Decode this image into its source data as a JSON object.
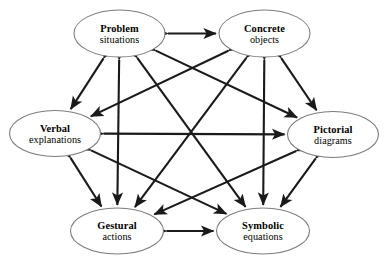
{
  "diagram": {
    "type": "hexagonal-network",
    "colors": {
      "background": "#ffffff",
      "node_fill": "#ffffff",
      "node_stroke": "#7d7d7d",
      "edge": "#1a1a1a",
      "text": "#000000"
    },
    "nodes": [
      {
        "id": "problem",
        "title": "Problem",
        "subtitle": "situations",
        "cx": 119.5,
        "cy": 33.5,
        "rx": 45.5,
        "ry": 23.5
      },
      {
        "id": "concrete",
        "title": "Concrete",
        "subtitle": "objects",
        "cx": 264.5,
        "cy": 33.5,
        "rx": 45.5,
        "ry": 23.5
      },
      {
        "id": "verbal",
        "title": "Verbal",
        "subtitle": "explanations",
        "cx": 55.0,
        "cy": 133.5,
        "rx": 45.5,
        "ry": 23.0
      },
      {
        "id": "pictorial",
        "title": "Pictorial",
        "subtitle": "diagrams",
        "cx": 333.0,
        "cy": 134.5,
        "rx": 45.5,
        "ry": 23.0
      },
      {
        "id": "gestural",
        "title": "Gestural",
        "subtitle": "actions",
        "cx": 117.0,
        "cy": 231.0,
        "rx": 46.5,
        "ry": 23.0
      },
      {
        "id": "symbolic",
        "title": "Symbolic",
        "subtitle": "equations",
        "cx": 263.0,
        "cy": 231.0,
        "rx": 46.5,
        "ry": 23.0
      }
    ],
    "edges": [
      {
        "id": "problem-concrete",
        "from": "problem",
        "to": "concrete",
        "arrows": "both"
      },
      {
        "id": "problem-verbal",
        "from": "problem",
        "to": "verbal",
        "arrows": "both"
      },
      {
        "id": "problem-pictorial",
        "from": "problem",
        "to": "pictorial",
        "arrows": "both"
      },
      {
        "id": "problem-gestural",
        "from": "problem",
        "to": "gestural",
        "arrows": "both"
      },
      {
        "id": "problem-symbolic",
        "from": "problem",
        "to": "symbolic",
        "arrows": "both"
      },
      {
        "id": "concrete-verbal",
        "from": "concrete",
        "to": "verbal",
        "arrows": "both"
      },
      {
        "id": "concrete-pictorial",
        "from": "concrete",
        "to": "pictorial",
        "arrows": "both"
      },
      {
        "id": "concrete-gestural",
        "from": "concrete",
        "to": "gestural",
        "arrows": "both"
      },
      {
        "id": "concrete-symbolic",
        "from": "concrete",
        "to": "symbolic",
        "arrows": "both"
      },
      {
        "id": "verbal-pictorial",
        "from": "verbal",
        "to": "pictorial",
        "arrows": "both"
      },
      {
        "id": "verbal-gestural",
        "from": "verbal",
        "to": "gestural",
        "arrows": "both"
      },
      {
        "id": "verbal-symbolic",
        "from": "verbal",
        "to": "symbolic",
        "arrows": "both"
      },
      {
        "id": "pictorial-gestural",
        "from": "pictorial",
        "to": "gestural",
        "arrows": "both"
      },
      {
        "id": "pictorial-symbolic",
        "from": "pictorial",
        "to": "symbolic",
        "arrows": "both"
      },
      {
        "id": "gestural-symbolic",
        "from": "gestural",
        "to": "symbolic",
        "arrows": "both"
      }
    ]
  }
}
